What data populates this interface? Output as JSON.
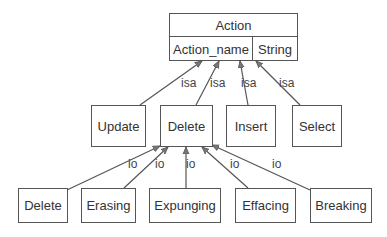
{
  "root": {
    "title": "Action",
    "attribute": {
      "name": "Action_name",
      "type": "String"
    }
  },
  "subtypes": [
    {
      "label": "Update",
      "edge_label": "isa"
    },
    {
      "label": "Delete",
      "edge_label": "isa"
    },
    {
      "label": "Insert",
      "edge_label": "isa"
    },
    {
      "label": "Select",
      "edge_label": "isa"
    }
  ],
  "instances": [
    {
      "label": "Delete",
      "edge_label": "io"
    },
    {
      "label": "Erasing",
      "edge_label": "io"
    },
    {
      "label": "Expunging",
      "edge_label": "io"
    },
    {
      "label": "Effacing",
      "edge_label": "io"
    },
    {
      "label": "Breaking",
      "edge_label": "io"
    }
  ],
  "colors": {
    "line": "#555555",
    "text": "#333333",
    "background": "#ffffff"
  }
}
